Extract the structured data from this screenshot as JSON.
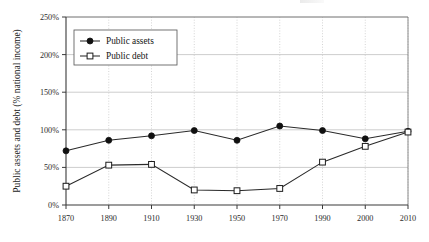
{
  "chart_data": {
    "type": "line",
    "title": "",
    "xlabel": "",
    "ylabel": "Public assets and debt (% national income)",
    "x": [
      1870,
      1890,
      1910,
      1930,
      1950,
      1970,
      1990,
      2000,
      2010
    ],
    "xticklabels": [
      "1870",
      "1890",
      "1910",
      "1930",
      "1950",
      "1970",
      "1990",
      "2000",
      "2010"
    ],
    "yticklabels": [
      "0%",
      "50%",
      "100%",
      "150%",
      "200%",
      "250%"
    ],
    "yticks": [
      0,
      50,
      100,
      150,
      200,
      250
    ],
    "ylim": [
      0,
      250
    ],
    "grid": "both",
    "legend_position": "top-left",
    "series": [
      {
        "name": "Public assets",
        "marker": "filled-circle",
        "values": [
          72,
          86,
          92,
          99,
          86,
          105,
          99,
          88,
          98
        ]
      },
      {
        "name": "Public debt",
        "marker": "open-square",
        "values": [
          25,
          53,
          54,
          20,
          19,
          22,
          57,
          78,
          97
        ]
      }
    ]
  },
  "legend": {
    "entries": [
      {
        "label": "Public assets",
        "marker": "filled-circle"
      },
      {
        "label": "Public debt",
        "marker": "open-square"
      }
    ]
  },
  "colors": {
    "line": "#2a2a2a",
    "grid_vertical": "#c9c9c9",
    "grid_horizontal": "#b8b8b8",
    "axis": "#3a3a3a",
    "background": "#ffffff"
  }
}
